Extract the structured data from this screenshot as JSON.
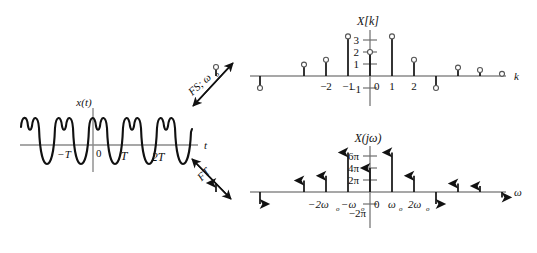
{
  "figure": {
    "title_hidden": "Fourier series and Fourier transform of a periodic signal",
    "colors": {
      "ink": "#111111",
      "axis": "#6f6f6f",
      "stem": "#111111",
      "background": "#ffffff"
    }
  },
  "time_panel": {
    "name": "time-domain-signal",
    "signal_label": "x(t)",
    "axis_label": "t",
    "tick_labels": [
      "−T",
      "0",
      "T",
      "2T"
    ],
    "period_label": "T",
    "description": "periodic waveform, two humps above axis per period with deep trough below"
  },
  "operators": [
    {
      "name": "fourier-series-operator",
      "label": "FS; ω",
      "subscript": "o",
      "arrow": "double-headed-diagonal-up"
    },
    {
      "name": "fourier-transform-operator",
      "label": "FT",
      "subscript": "",
      "arrow": "double-headed-diagonal-down"
    }
  ],
  "chart_data": [
    {
      "type": "bar",
      "name": "fourier-series-coefficients",
      "title": "X[k]",
      "xlabel": "k",
      "ylabel": "",
      "marker": "open-circle",
      "ylim": [
        -1.6,
        3.6
      ],
      "yticks": [
        3,
        2,
        1,
        -1
      ],
      "ytick_labels": [
        "3",
        "2",
        "1",
        "−1"
      ],
      "xticks": [
        -2,
        -1,
        0,
        1,
        2
      ],
      "xtick_labels": [
        "−2",
        "−1",
        "0",
        "1",
        "2"
      ],
      "origin_label": "0",
      "grid": false,
      "legend": false,
      "categories": [
        -7,
        -6,
        -5,
        -4,
        -3,
        -2,
        -1,
        0,
        1,
        2,
        3,
        4,
        5,
        6
      ],
      "values": [
        0.75,
        0,
        -1.0,
        0,
        0.95,
        1.35,
        3.3,
        2.0,
        3.3,
        1.35,
        -1.0,
        0.7,
        0.5,
        0.18
      ]
    },
    {
      "type": "bar",
      "name": "fourier-transform-spectrum",
      "title": "X(jω)",
      "xlabel": "ω",
      "ylabel": "",
      "marker": "arrowhead",
      "ylim": [
        -3.2,
        7.2
      ],
      "yticks": [
        6,
        4,
        2,
        -2
      ],
      "ytick_labels": [
        "6π",
        "4π",
        "2π",
        "−2π"
      ],
      "xticks": [
        -2,
        -1,
        0,
        1,
        2
      ],
      "xtick_labels": [
        "−2ω",
        "−ω",
        "0",
        "ω",
        "2ω"
      ],
      "xtick_subscripts": [
        "o",
        "o",
        "",
        "o",
        "o"
      ],
      "origin_label": "0",
      "grid": false,
      "legend": false,
      "categories": [
        -7,
        -6,
        -5,
        -4,
        -3,
        -2,
        -1,
        0,
        1,
        2,
        3,
        4,
        5,
        6
      ],
      "values": [
        1.5,
        0,
        -2.0,
        0,
        1.9,
        2.7,
        6.6,
        4.0,
        6.6,
        2.7,
        -2.0,
        1.4,
        1.0,
        -0.9
      ]
    }
  ]
}
